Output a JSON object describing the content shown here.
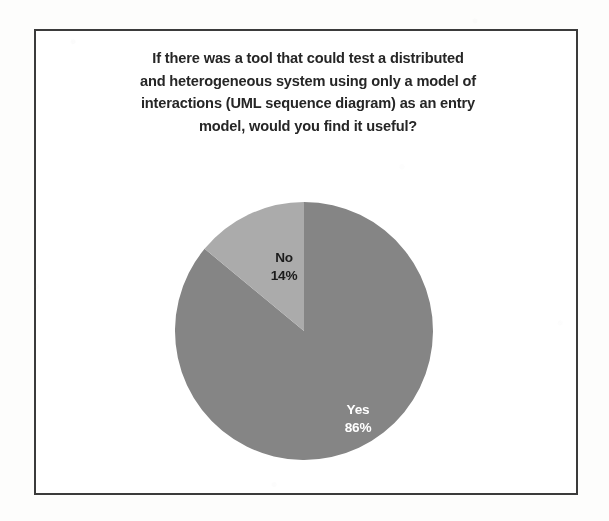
{
  "figure": {
    "title": "If there was a tool that could test a distributed\nand heterogeneous system using only a model of\ninteractions (UML sequence diagram) as an entry\nmodel, would you find it useful?",
    "border_color": "#3b3b3b",
    "plot_background": "#ffffff",
    "page_background": "#fdfdfc"
  },
  "chart_data": {
    "type": "pie",
    "title": "If there was a tool that could test a distributed and heterogeneous system using only a model of interactions (UML sequence diagram) as an entry model, would you find it useful?",
    "xlabel": "",
    "ylabel": "",
    "grid": false,
    "legend": "none",
    "label_format": "category name on first line, percentage on second line",
    "start_angle_deg": 0,
    "start_angle_note": "first slice boundary at 12 o'clock",
    "categories": [
      "Yes",
      "No"
    ],
    "values": [
      86,
      14
    ],
    "value_unit": "percent",
    "slices": [
      {
        "label": "Yes",
        "percent": 86,
        "percent_text": "86%",
        "color": "#858585",
        "label_color": "#ffffff",
        "direction_from_top": "clockwise",
        "sweep_deg": 309.6
      },
      {
        "label": "No",
        "percent": 14,
        "percent_text": "14%",
        "color": "#ababab",
        "label_color": "#1c1c1c",
        "direction_from_top": "counter-clockwise",
        "sweep_deg": 50.4
      }
    ]
  },
  "labels": {
    "no": "No\n14%",
    "yes": "Yes\n86%"
  }
}
